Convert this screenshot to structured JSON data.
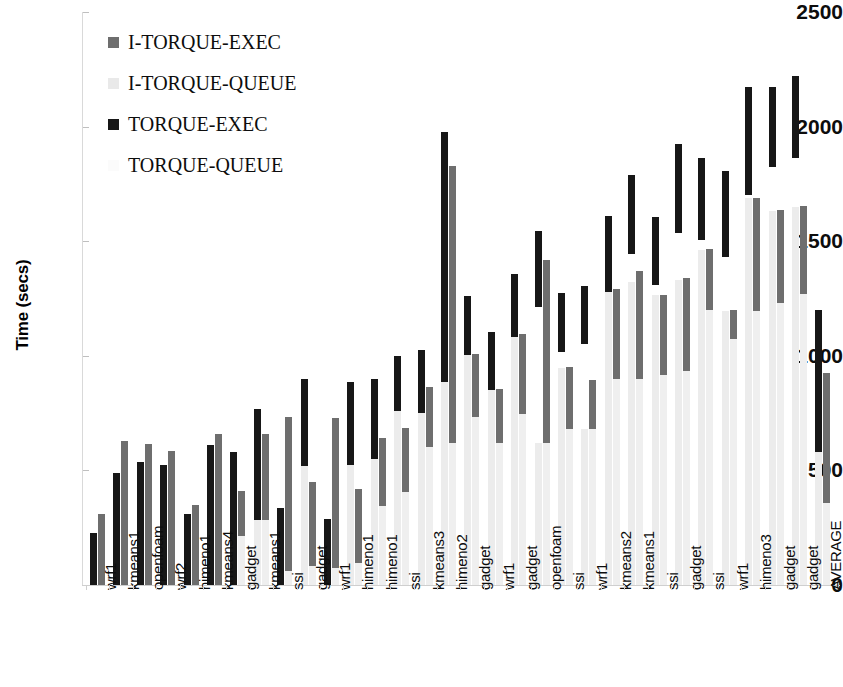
{
  "chart_data": {
    "type": "bar",
    "subtype": "stacked-grouped-bar",
    "title": "",
    "xlabel": "",
    "ylabel": "Time (secs)",
    "ylim": [
      0,
      2500
    ],
    "yticks": [
      0,
      500,
      1000,
      1500,
      2000,
      2500
    ],
    "grid": false,
    "legend_position": "top-left",
    "categories": [
      "wrf1",
      "kmeans1",
      "openfoam",
      "wrf2",
      "himeno1",
      "kmeans4",
      "gadget",
      "kmeans1",
      "ssi",
      "gadget",
      "wrf1",
      "himeno1",
      "himeno1",
      "ssi",
      "kmeans3",
      "himeno2",
      "gadget",
      "wrf1",
      "gadget",
      "openfoam",
      "ssi",
      "wrf1",
      "kmeans2",
      "kmeans1",
      "ssi",
      "gadget",
      "ssi",
      "wrf1",
      "himeno3",
      "gadget",
      "gadget",
      "AVERAGE"
    ],
    "series": [
      {
        "name": "TORQUE-QUEUE",
        "color": "#ececec",
        "values": [
          0,
          0,
          0,
          0,
          0,
          0,
          0,
          0,
          0,
          0,
          0,
          0,
          0,
          0,
          0,
          0,
          0,
          0,
          0,
          0,
          0,
          0,
          0,
          0,
          0,
          0,
          0,
          0,
          0,
          0,
          0,
          0
        ]
      },
      {
        "name": "TORQUE-EXEC",
        "color": "#171717",
        "values": [
          225,
          490,
          535,
          525,
          310,
          610,
          580,
          490,
          335,
          520,
          290,
          525,
          550,
          760,
          855,
          885,
          1005,
          850,
          1080,
          620,
          945,
          680,
          1280,
          1320,
          1265,
          1330,
          1460,
          1195,
          1690,
          1630,
          1650,
          580
        ]
      },
      {
        "name": "I-TORQUE-QUEUE",
        "color": "#efefef",
        "values": [
          0,
          0,
          0,
          0,
          0,
          0,
          230,
          285,
          50,
          85,
          75,
          95,
          345,
          405,
          600,
          620,
          0,
          0,
          0,
          0,
          0,
          0,
          0,
          0,
          0,
          0,
          0,
          0,
          0,
          0,
          0,
          358
        ]
      },
      {
        "name": "I-TORQUE-EXEC",
        "color": "#6e6e6e",
        "values": [
          87,
          140,
          80,
          60,
          45,
          55,
          180,
          380,
          110,
          130,
          140,
          190,
          290,
          280,
          260,
          1210,
          0,
          0,
          0,
          0,
          0,
          0,
          0,
          0,
          0,
          0,
          0,
          0,
          0,
          0,
          0,
          567
        ]
      }
    ],
    "bars": [
      {
        "category": "wrf1",
        "torque": {
          "queue": 0,
          "exec_top": 225,
          "exec_bottom": 0
        },
        "itorque": {
          "queue": 0,
          "exec_top": 312,
          "exec_bottom": 0
        }
      },
      {
        "category": "kmeans1",
        "torque": {
          "queue": 0,
          "exec_top": 490,
          "exec_bottom": 0
        },
        "itorque": {
          "queue": 0,
          "exec_top": 630,
          "exec_bottom": 0
        }
      },
      {
        "category": "openfoam",
        "torque": {
          "queue": 0,
          "exec_top": 535,
          "exec_bottom": 0
        },
        "itorque": {
          "queue": 0,
          "exec_top": 615,
          "exec_bottom": 0
        }
      },
      {
        "category": "wrf2",
        "torque": {
          "queue": 0,
          "exec_top": 525,
          "exec_bottom": 0
        },
        "itorque": {
          "queue": 0,
          "exec_top": 585,
          "exec_bottom": 0
        }
      },
      {
        "category": "himeno1",
        "torque": {
          "queue": 0,
          "exec_top": 310,
          "exec_bottom": 0
        },
        "itorque": {
          "queue": 0,
          "exec_top": 350,
          "exec_bottom": 0
        }
      },
      {
        "category": "kmeans4",
        "torque": {
          "queue": 0,
          "exec_top": 610,
          "exec_bottom": 0
        },
        "itorque": {
          "queue": 0,
          "exec_top": 660,
          "exec_bottom": 0
        }
      },
      {
        "category": "gadget",
        "torque": {
          "queue": 0,
          "exec_top": 580,
          "exec_bottom": 0
        },
        "itorque": {
          "queue": 215,
          "exec_top": 410,
          "exec_bottom": 215
        }
      },
      {
        "category": "kmeans1",
        "torque": {
          "queue": 285,
          "exec_top": 770,
          "exec_bottom": 285
        },
        "itorque": {
          "queue": 285,
          "exec_top": 660,
          "exec_bottom": 285
        }
      },
      {
        "category": "ssi",
        "torque": {
          "queue": 0,
          "exec_top": 335,
          "exec_bottom": 0
        },
        "itorque": {
          "queue": 60,
          "exec_top": 735,
          "exec_bottom": 60
        }
      },
      {
        "category": "gadget",
        "torque": {
          "queue": 520,
          "exec_top": 900,
          "exec_bottom": 520
        },
        "itorque": {
          "queue": 85,
          "exec_top": 450,
          "exec_bottom": 85
        }
      },
      {
        "category": "wrf1",
        "torque": {
          "queue": 0,
          "exec_top": 290,
          "exec_bottom": 0
        },
        "itorque": {
          "queue": 75,
          "exec_top": 730,
          "exec_bottom": 75
        }
      },
      {
        "category": "himeno1",
        "torque": {
          "queue": 525,
          "exec_top": 885,
          "exec_bottom": 525
        },
        "itorque": {
          "queue": 95,
          "exec_top": 420,
          "exec_bottom": 95
        }
      },
      {
        "category": "himeno1",
        "torque": {
          "queue": 550,
          "exec_top": 900,
          "exec_bottom": 550
        },
        "itorque": {
          "queue": 345,
          "exec_top": 640,
          "exec_bottom": 345
        }
      },
      {
        "category": "ssi",
        "torque": {
          "queue": 760,
          "exec_top": 1000,
          "exec_bottom": 760
        },
        "itorque": {
          "queue": 405,
          "exec_top": 685,
          "exec_bottom": 405
        }
      },
      {
        "category": "kmeans3",
        "torque": {
          "queue": 855,
          "exec_top": 1025,
          "exec_bottom": 750
        },
        "itorque": {
          "queue": 600,
          "exec_top": 865,
          "exec_bottom": 600
        }
      },
      {
        "category": "himeno2",
        "torque": {
          "queue": 885,
          "exec_top": 1975,
          "exec_bottom": 885
        },
        "itorque": {
          "queue": 620,
          "exec_top": 1830,
          "exec_bottom": 620
        }
      },
      {
        "category": "gadget",
        "torque": {
          "queue": 1005,
          "exec_top": 1260,
          "exec_bottom": 1005
        },
        "itorque": {
          "queue": 735,
          "exec_top": 1010,
          "exec_bottom": 735
        }
      },
      {
        "category": "wrf1",
        "torque": {
          "queue": 850,
          "exec_top": 1105,
          "exec_bottom": 850
        },
        "itorque": {
          "queue": 620,
          "exec_top": 855,
          "exec_bottom": 620
        }
      },
      {
        "category": "gadget",
        "torque": {
          "queue": 1080,
          "exec_top": 1355,
          "exec_bottom": 1080
        },
        "itorque": {
          "queue": 745,
          "exec_top": 1095,
          "exec_bottom": 745
        }
      },
      {
        "category": "openfoam",
        "torque": {
          "queue": 620,
          "exec_top": 1545,
          "exec_bottom": 1215
        },
        "itorque": {
          "queue": 620,
          "exec_top": 1420,
          "exec_bottom": 620
        }
      },
      {
        "category": "ssi",
        "torque": {
          "queue": 945,
          "exec_top": 1275,
          "exec_bottom": 1015
        },
        "itorque": {
          "queue": 680,
          "exec_top": 950,
          "exec_bottom": 680
        }
      },
      {
        "category": "wrf1",
        "torque": {
          "queue": 680,
          "exec_top": 1305,
          "exec_bottom": 1050
        },
        "itorque": {
          "queue": 680,
          "exec_top": 895,
          "exec_bottom": 680
        }
      },
      {
        "category": "kmeans2",
        "torque": {
          "queue": 1280,
          "exec_top": 1610,
          "exec_bottom": 1280
        },
        "itorque": {
          "queue": 900,
          "exec_top": 1290,
          "exec_bottom": 900
        }
      },
      {
        "category": "kmeans1",
        "torque": {
          "queue": 1320,
          "exec_top": 1790,
          "exec_bottom": 1445
        },
        "itorque": {
          "queue": 900,
          "exec_top": 1370,
          "exec_bottom": 900
        }
      },
      {
        "category": "ssi",
        "torque": {
          "queue": 1265,
          "exec_top": 1605,
          "exec_bottom": 1310
        },
        "itorque": {
          "queue": 915,
          "exec_top": 1265,
          "exec_bottom": 915
        }
      },
      {
        "category": "gadget",
        "torque": {
          "queue": 1330,
          "exec_top": 1925,
          "exec_bottom": 1535
        },
        "itorque": {
          "queue": 935,
          "exec_top": 1340,
          "exec_bottom": 935
        }
      },
      {
        "category": "ssi",
        "torque": {
          "queue": 1460,
          "exec_top": 1865,
          "exec_bottom": 1505
        },
        "itorque": {
          "queue": 1200,
          "exec_top": 1465,
          "exec_bottom": 1200
        }
      },
      {
        "category": "wrf1",
        "torque": {
          "queue": 1195,
          "exec_top": 1805,
          "exec_bottom": 1430
        },
        "itorque": {
          "queue": 1075,
          "exec_top": 1200,
          "exec_bottom": 1075
        }
      },
      {
        "category": "himeno3",
        "torque": {
          "queue": 1690,
          "exec_top": 2175,
          "exec_bottom": 1700
        },
        "itorque": {
          "queue": 1195,
          "exec_top": 1690,
          "exec_bottom": 1195
        }
      },
      {
        "category": "gadget",
        "torque": {
          "queue": 1630,
          "exec_top": 2175,
          "exec_bottom": 1825
        },
        "itorque": {
          "queue": 1230,
          "exec_top": 1635,
          "exec_bottom": 1230
        }
      },
      {
        "category": "gadget",
        "torque": {
          "queue": 1650,
          "exec_top": 2220,
          "exec_bottom": 1865
        },
        "itorque": {
          "queue": 1270,
          "exec_top": 1655,
          "exec_bottom": 1270
        }
      },
      {
        "category": "AVERAGE",
        "torque": {
          "queue": 580,
          "exec_top": 1200,
          "exec_bottom": 580
        },
        "itorque": {
          "queue": 358,
          "exec_top": 925,
          "exec_bottom": 358
        }
      }
    ]
  },
  "axis": {
    "y_title": "Time (secs)",
    "y_ticks": [
      "2500",
      "2000",
      "1500",
      "1000",
      "500",
      "0"
    ]
  },
  "legend": {
    "items": [
      {
        "label": "I-TORQUE-EXEC",
        "swatch": "sw-exec-gray"
      },
      {
        "label": "I-TORQUE-QUEUE",
        "swatch": "sw-queue-gray"
      },
      {
        "label": "TORQUE-EXEC",
        "swatch": "sw-exec-dark"
      },
      {
        "label": "TORQUE-QUEUE",
        "swatch": "sw-queue-light"
      }
    ]
  }
}
